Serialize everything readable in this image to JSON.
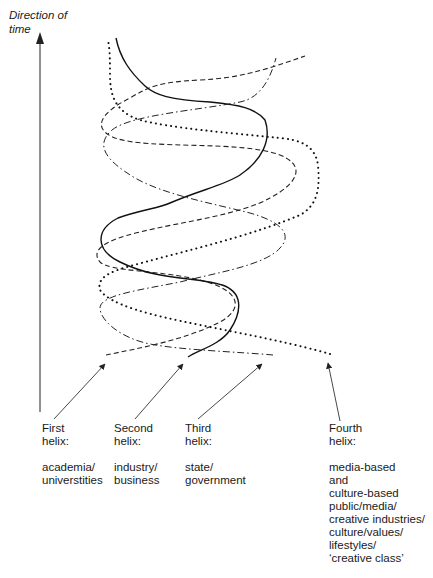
{
  "axis": {
    "label_line1": "Direction of",
    "label_line2": "time"
  },
  "helices": [
    {
      "id": "first",
      "title_line1": "First",
      "title_line2": "helix:",
      "desc_lines": [
        "academia/",
        "universtities"
      ],
      "line_style": "dashed"
    },
    {
      "id": "second",
      "title_line1": "Second",
      "title_line2": "helix:",
      "desc_lines": [
        "industry/",
        "business"
      ],
      "line_style": "solid"
    },
    {
      "id": "third",
      "title_line1": "Third",
      "title_line2": "helix:",
      "desc_lines": [
        "state/",
        "government"
      ],
      "line_style": "dash-dot"
    },
    {
      "id": "fourth",
      "title_line1": "Fourth",
      "title_line2": "helix:",
      "desc_lines": [
        "media-based",
        "and",
        "culture-based",
        "public/media/",
        "creative industries/",
        "culture/values/",
        "lifestyles/",
        "‘creative class’"
      ],
      "line_style": "dotted"
    }
  ],
  "colors": {
    "line": "#1a1a1a",
    "arrow": "#333333",
    "background": "#ffffff"
  }
}
